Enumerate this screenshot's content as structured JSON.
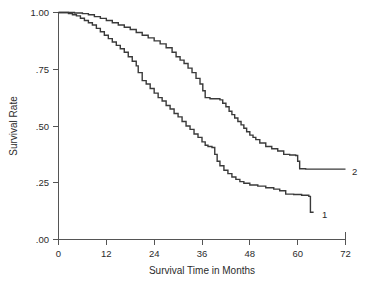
{
  "chart_data": {
    "type": "line",
    "title": "",
    "xlabel": "Survival Time in Months",
    "ylabel": "Survival Rate",
    "xlim": [
      0,
      72
    ],
    "ylim": [
      0.0,
      1.0
    ],
    "xticks": [
      0,
      12,
      24,
      36,
      48,
      60,
      72
    ],
    "xtick_labels": [
      "0",
      "12",
      "24",
      "36",
      "48",
      "60",
      "72"
    ],
    "yticks": [
      0.0,
      0.25,
      0.5,
      0.75,
      1.0
    ],
    "ytick_labels": [
      ".00",
      ".25",
      ".50",
      ".75",
      "1.00"
    ],
    "grid": false,
    "legend_position": "inline-right-endpoint",
    "series": [
      {
        "name": "1",
        "label": "1",
        "color": "#3a3a3a",
        "step": "post",
        "points": [
          [
            0.0,
            1.0
          ],
          [
            1.5,
            1.0
          ],
          [
            2.5,
            0.995
          ],
          [
            3.5,
            0.99
          ],
          [
            4.5,
            0.985
          ],
          [
            5.5,
            0.975
          ],
          [
            6.5,
            0.965
          ],
          [
            7.5,
            0.955
          ],
          [
            8.5,
            0.945
          ],
          [
            9.5,
            0.93
          ],
          [
            10.5,
            0.915
          ],
          [
            11.5,
            0.9
          ],
          [
            12.5,
            0.885
          ],
          [
            13.5,
            0.87
          ],
          [
            14.5,
            0.855
          ],
          [
            15.5,
            0.84
          ],
          [
            16.5,
            0.825
          ],
          [
            17.5,
            0.805
          ],
          [
            18.5,
            0.785
          ],
          [
            19.5,
            0.765
          ],
          [
            20.0,
            0.735
          ],
          [
            21.0,
            0.7
          ],
          [
            22.0,
            0.685
          ],
          [
            23.0,
            0.665
          ],
          [
            24.0,
            0.645
          ],
          [
            25.0,
            0.625
          ],
          [
            26.0,
            0.61
          ],
          [
            27.0,
            0.59
          ],
          [
            28.0,
            0.575
          ],
          [
            29.0,
            0.555
          ],
          [
            30.0,
            0.54
          ],
          [
            31.0,
            0.52
          ],
          [
            32.0,
            0.5
          ],
          [
            33.0,
            0.485
          ],
          [
            34.0,
            0.465
          ],
          [
            35.0,
            0.45
          ],
          [
            36.0,
            0.43
          ],
          [
            36.8,
            0.415
          ],
          [
            37.5,
            0.41
          ],
          [
            38.5,
            0.405
          ],
          [
            39.2,
            0.375
          ],
          [
            39.8,
            0.345
          ],
          [
            40.5,
            0.325
          ],
          [
            41.5,
            0.305
          ],
          [
            42.5,
            0.29
          ],
          [
            43.5,
            0.275
          ],
          [
            44.5,
            0.265
          ],
          [
            45.5,
            0.255
          ],
          [
            46.5,
            0.248
          ],
          [
            48.0,
            0.24
          ],
          [
            50.0,
            0.235
          ],
          [
            52.0,
            0.228
          ],
          [
            54.0,
            0.222
          ],
          [
            55.5,
            0.215
          ],
          [
            57.0,
            0.2
          ],
          [
            59.0,
            0.198
          ],
          [
            61.0,
            0.195
          ],
          [
            62.8,
            0.19
          ],
          [
            63.2,
            0.12
          ],
          [
            64.0,
            0.12
          ]
        ],
        "endpoint": [
          64.0,
          0.12
        ],
        "final_survival_rate": 0.12
      },
      {
        "name": "2",
        "label": "2",
        "color": "#3a3a3a",
        "step": "post",
        "points": [
          [
            0.0,
            1.0
          ],
          [
            2.0,
            1.0
          ],
          [
            4.0,
            0.998
          ],
          [
            6.0,
            0.995
          ],
          [
            7.5,
            0.99
          ],
          [
            9.0,
            0.982
          ],
          [
            10.5,
            0.974
          ],
          [
            12.0,
            0.965
          ],
          [
            13.5,
            0.955
          ],
          [
            15.0,
            0.945
          ],
          [
            16.5,
            0.935
          ],
          [
            18.0,
            0.925
          ],
          [
            19.5,
            0.912
          ],
          [
            21.0,
            0.9
          ],
          [
            22.5,
            0.888
          ],
          [
            24.0,
            0.875
          ],
          [
            25.5,
            0.862
          ],
          [
            27.0,
            0.845
          ],
          [
            28.5,
            0.825
          ],
          [
            29.5,
            0.805
          ],
          [
            30.5,
            0.79
          ],
          [
            31.5,
            0.775
          ],
          [
            32.5,
            0.755
          ],
          [
            33.5,
            0.735
          ],
          [
            34.5,
            0.71
          ],
          [
            35.5,
            0.685
          ],
          [
            36.2,
            0.655
          ],
          [
            36.8,
            0.625
          ],
          [
            38.0,
            0.62
          ],
          [
            40.0,
            0.62
          ],
          [
            40.5,
            0.615
          ],
          [
            41.2,
            0.6
          ],
          [
            42.0,
            0.585
          ],
          [
            42.8,
            0.565
          ],
          [
            43.5,
            0.55
          ],
          [
            44.2,
            0.535
          ],
          [
            45.0,
            0.52
          ],
          [
            45.8,
            0.505
          ],
          [
            46.5,
            0.49
          ],
          [
            47.2,
            0.475
          ],
          [
            48.0,
            0.46
          ],
          [
            48.8,
            0.45
          ],
          [
            49.5,
            0.44
          ],
          [
            50.5,
            0.425
          ],
          [
            52.0,
            0.41
          ],
          [
            53.5,
            0.4
          ],
          [
            55.0,
            0.39
          ],
          [
            56.5,
            0.375
          ],
          [
            58.0,
            0.372
          ],
          [
            59.5,
            0.37
          ],
          [
            60.0,
            0.345
          ],
          [
            60.5,
            0.312
          ],
          [
            62.0,
            0.31
          ],
          [
            66.0,
            0.31
          ],
          [
            72.0,
            0.31
          ]
        ],
        "endpoint": [
          72.0,
          0.31
        ],
        "final_survival_rate": 0.31
      }
    ]
  },
  "axes": {
    "y_title": "Survival Rate",
    "x_title": "Survival Time in Months",
    "y_labels": [
      "1.00",
      ".75",
      ".50",
      ".25",
      ".00"
    ],
    "x_labels": [
      "0",
      "12",
      "24",
      "36",
      "48",
      "60",
      "72"
    ]
  },
  "series_labels": {
    "curve_one": "1",
    "curve_two": "2"
  },
  "colors": {
    "curve": "#3a3a3a",
    "axis": "#555555",
    "text": "#2b2b2b",
    "background": "#ffffff"
  }
}
